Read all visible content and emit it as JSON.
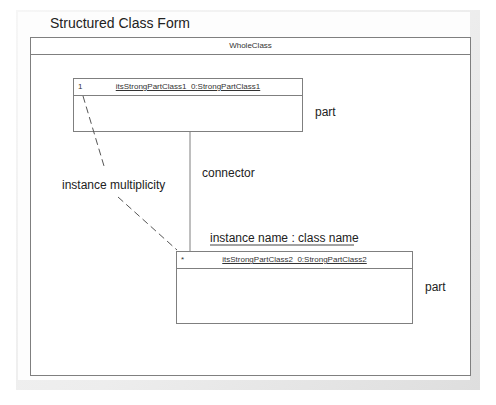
{
  "diagram": {
    "title": "Structured Class Form",
    "whole_class": {
      "name": "WholeClass"
    },
    "parts": [
      {
        "multiplicity": "1",
        "name": "itsStrongPartClass1_0:StrongPartClass1",
        "annotation": "part"
      },
      {
        "multiplicity": "*",
        "name": "itsStrongPartClass2_0:StrongPartClass2",
        "annotation": "part"
      }
    ],
    "annotations": {
      "connector": "connector",
      "instance_multiplicity": "instance multiplicity",
      "instance_name": "instance name : class name"
    },
    "colors": {
      "line": "#7f7f7f",
      "frame": "#e6e6e6",
      "text": "#222222"
    }
  }
}
